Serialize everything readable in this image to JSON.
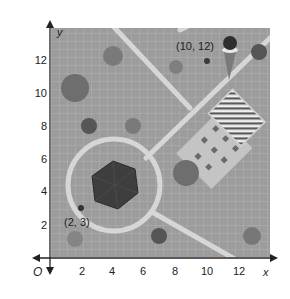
{
  "figure": {
    "type": "coordinate-grid-map",
    "axes": {
      "x_label": "x",
      "y_label": "y",
      "origin_label": "O",
      "x_ticks": [
        "2",
        "4",
        "6",
        "8",
        "10",
        "12"
      ],
      "y_ticks": [
        "2",
        "4",
        "6",
        "8",
        "10",
        "12"
      ]
    },
    "points": [
      {
        "label": "(2, 3)",
        "x": 2,
        "y": 3
      },
      {
        "label": "(10, 12)",
        "x": 10,
        "y": 12
      }
    ],
    "features": [
      {
        "name": "circular-path",
        "description": "ring-shaped walking path centered near (4.5, 4.5)"
      },
      {
        "name": "hexagon-structure",
        "description": "dark hexagonal structure inside the ring"
      },
      {
        "name": "diagonal-paths",
        "description": "light paths crossing the park"
      },
      {
        "name": "striped-court",
        "description": "rectangle with diagonal stripes, upper right"
      },
      {
        "name": "picnic-area",
        "description": "tilted square area with small tables"
      },
      {
        "name": "ice-cream-cone",
        "description": "cone icon near (10, 12)"
      },
      {
        "name": "trees",
        "description": "round tree canopies scattered"
      }
    ],
    "colors": {
      "background": "#9c9c9c",
      "grid": "#b4b4b4",
      "path": "#d9d9d9",
      "tree_dark": "#5e5e5e",
      "tree_mid": "#7a7a7a",
      "axis": "#222222"
    }
  }
}
